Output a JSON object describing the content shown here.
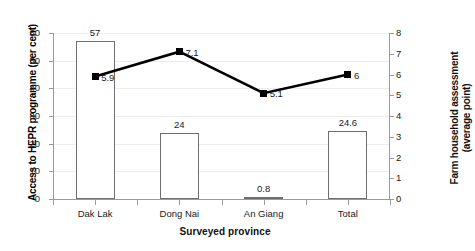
{
  "chart_data": {
    "type": "bar",
    "title": "",
    "subtitle": "",
    "xlabel": "Surveyed province",
    "categories": [
      "Dak Lak",
      "Dong Nai",
      "An Giang",
      "Total"
    ],
    "grid": true,
    "legend": "none",
    "axes": {
      "left": {
        "label": "Access to HEPR programme (per cent)",
        "ticks": [
          0,
          10,
          20,
          30,
          40,
          50,
          60
        ],
        "lim": [
          0,
          60
        ]
      },
      "right": {
        "label_line1": "Farm household assessment",
        "label_line2": "(average point)",
        "ticks": [
          0,
          1,
          2,
          3,
          4,
          5,
          6,
          7,
          8
        ],
        "lim": [
          0,
          8
        ]
      }
    },
    "series": [
      {
        "name": "Access to HEPR programme (per cent)",
        "render": "bar",
        "axis": "left",
        "values": [
          57,
          24,
          0.8,
          24.6
        ],
        "data_labels": [
          "57",
          "24",
          "0.8",
          "24.6"
        ]
      },
      {
        "name": "Farm household assessment (average point)",
        "render": "line",
        "axis": "right",
        "values": [
          5.9,
          7.1,
          5.1,
          6
        ],
        "data_labels": [
          "5.9",
          "7.1",
          "5.1",
          "6"
        ]
      }
    ],
    "colors": {
      "bar_outline": "#6f6f6f",
      "bar_fill": "#ffffff",
      "line": "#000000",
      "marker": "#000000",
      "gridline": "#ededed",
      "axis": "#9a9a9a",
      "text": "#1a1a1a"
    }
  }
}
